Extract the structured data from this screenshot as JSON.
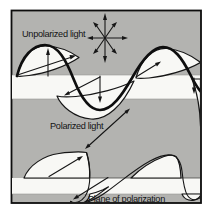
{
  "figure": {
    "labels": {
      "unpolarized": "Unpolarized light",
      "polarized": "Polarized light",
      "plane": "Plane of polarization"
    },
    "colors": {
      "background_gray": "#b3b3b0",
      "plane_band_white": "#f8f8f5",
      "line_black": "#0e0e0e",
      "page_white": "#ffffff"
    },
    "symbols": {
      "unpolarized_star_arrow_count": 8,
      "polarized_double_arrow": "diagonal, double-headed"
    }
  }
}
